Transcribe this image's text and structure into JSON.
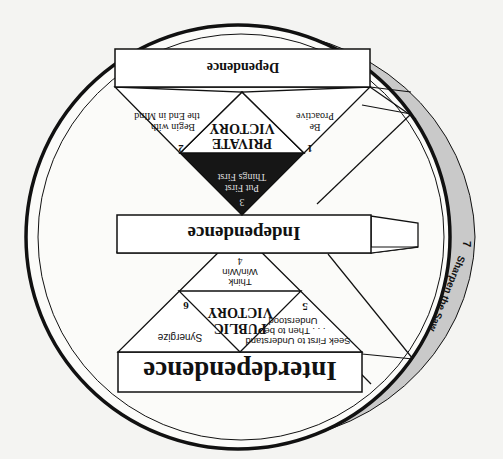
{
  "diagram": {
    "orientation": "rotated 180 degrees",
    "levels": {
      "dependence": "Dependence",
      "independence": "Independence",
      "interdependence": "Interdependence"
    },
    "victories": {
      "private": [
        "PRIVATE",
        "VICTORY"
      ],
      "public": [
        "PUBLIC",
        "VICTORY"
      ]
    },
    "habits": [
      {
        "number": "1",
        "lines": [
          "Be",
          "Proactive"
        ]
      },
      {
        "number": "2",
        "lines": [
          "Begin with",
          "the End in Mind"
        ]
      },
      {
        "number": "3",
        "lines": [
          "Put First",
          "Things First"
        ]
      },
      {
        "number": "4",
        "lines": [
          "Think",
          "Win/Win"
        ]
      },
      {
        "number": "5",
        "lines": [
          "Seek First to Understand",
          ". . . Then to be",
          "Understood"
        ]
      },
      {
        "number": "6",
        "lines": [
          "Synergize"
        ]
      },
      {
        "number": "7",
        "lines": [
          "Sharpen the Saw"
        ]
      }
    ],
    "colors": {
      "background": "#f4f4f2",
      "line": "#111111",
      "crescent": "#c8c8c8",
      "habit3_fill": "#161616"
    }
  }
}
